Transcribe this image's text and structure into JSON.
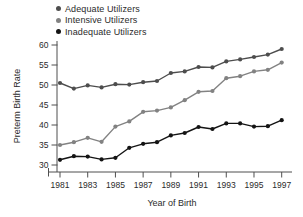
{
  "chart": {
    "y_axis_label": "Preterm Birth Rate",
    "x_axis_label": "Year of Birth"
  },
  "chart_data": {
    "type": "line",
    "title": "",
    "xlabel": "Year of Birth",
    "ylabel": "Preterm Birth Rate",
    "x": [
      1981,
      1982,
      1983,
      1984,
      1985,
      1986,
      1987,
      1988,
      1989,
      1990,
      1991,
      1992,
      1993,
      1994,
      1995,
      1996,
      1997
    ],
    "xlim": [
      1981,
      1997
    ],
    "ylim": [
      30,
      60
    ],
    "y_ticks": [
      30,
      35,
      40,
      45,
      50,
      55,
      60
    ],
    "x_tick_years": [
      1981,
      1983,
      1985,
      1987,
      1989,
      1991,
      1993,
      1995,
      1997
    ],
    "x_tick_labels": [
      "1981",
      "1983",
      "1985",
      "1987",
      "1989",
      "1991",
      "1993",
      "1995",
      "1997"
    ],
    "grid": false,
    "legend_position": "top-left",
    "marker": "circle",
    "series": [
      {
        "name": "Adequate Utilizers",
        "color": "#4d4d4d",
        "values": [
          50.5,
          49.1,
          49.9,
          49.4,
          50.2,
          50.1,
          50.7,
          51.0,
          53.0,
          53.4,
          54.5,
          54.4,
          55.9,
          56.4,
          57.0,
          57.6,
          59.0
        ]
      },
      {
        "name": "Intensive Utilizers",
        "color": "#828282",
        "values": [
          35.0,
          35.7,
          36.8,
          35.8,
          39.6,
          40.9,
          43.3,
          43.6,
          44.4,
          46.2,
          48.3,
          48.5,
          51.7,
          52.2,
          53.4,
          53.8,
          55.6
        ]
      },
      {
        "name": "Inadequate Utilizers",
        "color": "#141414",
        "values": [
          31.3,
          32.2,
          32.1,
          31.4,
          31.8,
          34.3,
          35.3,
          35.7,
          37.4,
          38.0,
          39.5,
          39.0,
          40.4,
          40.4,
          39.6,
          39.7,
          41.2
        ]
      }
    ],
    "axis_color": "#4f4f4f"
  }
}
